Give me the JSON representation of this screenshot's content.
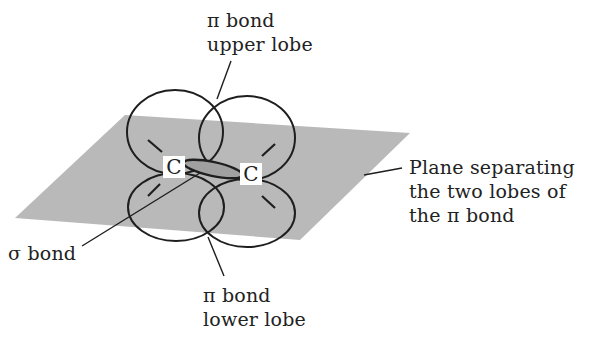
{
  "diagram": {
    "colors": {
      "plane_fill": "#b9b9b9",
      "stroke": "#1e1e1e",
      "background": "#ffffff"
    },
    "atoms": [
      {
        "symbol": "C"
      },
      {
        "symbol": "C"
      }
    ],
    "labels": {
      "pi_upper": {
        "line1": "π bond",
        "line2": "upper lobe"
      },
      "plane": {
        "line1": "Plane separating",
        "line2": "the two lobes of",
        "line3": "the π bond"
      },
      "sigma": {
        "line1": "σ bond"
      },
      "pi_lower": {
        "line1": "π bond",
        "line2": "lower lobe"
      }
    }
  }
}
